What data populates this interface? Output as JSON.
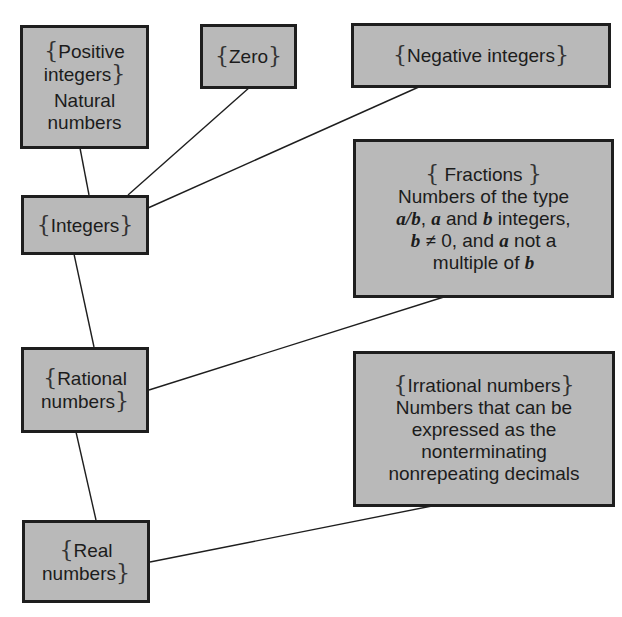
{
  "diagram": {
    "type": "hierarchy",
    "colors": {
      "box_fill": "#b9b9b9",
      "box_border": "#1e1e1e",
      "line": "#1e1e1e",
      "background": "#ffffff"
    },
    "nodes": {
      "positive": {
        "set_lines": [
          "Positive",
          "integers"
        ],
        "desc_lines": [
          "Natural",
          "numbers"
        ]
      },
      "zero": {
        "set_lines": [
          "Zero"
        ]
      },
      "negative": {
        "set_lines": [
          "Negative integers"
        ]
      },
      "integers": {
        "set_lines": [
          "Integers"
        ]
      },
      "fractions": {
        "set_lines": [
          "Fractions"
        ],
        "desc_lines": [
          "Numbers of the type",
          "a/b, a and b integers,",
          "b ≠ 0, and a not a",
          "multiple of b"
        ]
      },
      "rational": {
        "set_lines": [
          "Rational",
          "numbers"
        ]
      },
      "irrational": {
        "set_lines": [
          "Irrational numbers"
        ],
        "desc_lines": [
          "Numbers that can be",
          "expressed as the",
          "nonterminating",
          "nonrepeating decimals"
        ]
      },
      "real": {
        "set_lines": [
          "Real",
          "numbers"
        ]
      }
    },
    "edges": [
      [
        "positive",
        "integers"
      ],
      [
        "zero",
        "integers"
      ],
      [
        "negative",
        "integers"
      ],
      [
        "integers",
        "rational"
      ],
      [
        "fractions",
        "rational"
      ],
      [
        "rational",
        "real"
      ],
      [
        "irrational",
        "real"
      ]
    ],
    "braces": {
      "open": "{",
      "close": "}"
    },
    "math": {
      "a_over_b": "a/b",
      "a": "a",
      "b": "b",
      "neq": "≠",
      "zero": "0"
    },
    "text": {
      "and": " and ",
      "integers_comma": " integers,",
      "comma_space": ", ",
      "zero_and": ", and ",
      "not_a": " not a",
      "multiple_of": "multiple of "
    }
  }
}
